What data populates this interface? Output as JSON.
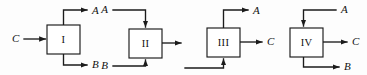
{
  "figure": {
    "type": "block-diagram",
    "background_color": "#fdfdfd",
    "line_color": "#1b1b1b",
    "box_fill": "#ffffff",
    "width": 367,
    "height": 75
  },
  "blocks": [
    {
      "id": "block-1",
      "label": "I",
      "box": {
        "x": 47,
        "y": 25,
        "w": 33,
        "h": 29
      },
      "ports": [
        {
          "name": "input-c",
          "label": "C",
          "side": "left",
          "direction": "in",
          "label_x": 12,
          "label_y": 39,
          "label_anchor": "start"
        },
        {
          "name": "output-a",
          "label": "A",
          "side": "top",
          "direction": "out",
          "label_x": 92,
          "label_y": 11,
          "label_anchor": "start"
        },
        {
          "name": "output-b",
          "label": "B",
          "side": "bottom",
          "direction": "out",
          "label_x": 92,
          "label_y": 65,
          "label_anchor": "start"
        }
      ]
    },
    {
      "id": "block-2",
      "label": "II",
      "box": {
        "x": 129,
        "y": 29,
        "w": 33,
        "h": 29
      },
      "ports": [
        {
          "name": "input-a",
          "label": "A",
          "side": "top",
          "direction": "in",
          "label_x": 108,
          "label_y": 10,
          "label_anchor": "end"
        },
        {
          "name": "input-b",
          "label": "B",
          "side": "bottom",
          "direction": "in",
          "label_x": 108,
          "label_y": 66,
          "label_anchor": "end"
        },
        {
          "name": "output-right",
          "label": "",
          "side": "right",
          "direction": "out",
          "label_x": 0,
          "label_y": 0,
          "label_anchor": "start"
        }
      ]
    },
    {
      "id": "block-3",
      "label": "III",
      "box": {
        "x": 207,
        "y": 28,
        "w": 33,
        "h": 29
      },
      "ports": [
        {
          "name": "input-bottom",
          "label": "",
          "side": "bottom",
          "direction": "in",
          "label_x": 0,
          "label_y": 0,
          "label_anchor": "start"
        },
        {
          "name": "output-a",
          "label": "A",
          "side": "top",
          "direction": "out",
          "label_x": 253,
          "label_y": 11,
          "label_anchor": "start"
        },
        {
          "name": "output-c",
          "label": "C",
          "side": "right",
          "direction": "out",
          "label_x": 267,
          "label_y": 42,
          "label_anchor": "start"
        }
      ]
    },
    {
      "id": "block-4",
      "label": "IV",
      "box": {
        "x": 290,
        "y": 28,
        "w": 33,
        "h": 29
      },
      "ports": [
        {
          "name": "input-a",
          "label": "A",
          "side": "top",
          "direction": "in",
          "label_x": 341,
          "label_y": 10,
          "label_anchor": "start"
        },
        {
          "name": "output-c",
          "label": "C",
          "side": "right",
          "direction": "out",
          "label_x": 352,
          "label_y": 42,
          "label_anchor": "start"
        },
        {
          "name": "output-b",
          "label": "B",
          "side": "bottom",
          "direction": "out",
          "label_x": 344,
          "label_y": 67,
          "label_anchor": "start"
        }
      ]
    }
  ],
  "labels": {
    "block_1": "I",
    "block_2": "II",
    "block_3": "III",
    "block_4": "IV",
    "b1_c": "C",
    "b1_a": "A",
    "b1_b": "B",
    "b2_a": "A",
    "b2_b": "B",
    "b3_a": "A",
    "b3_c": "C",
    "b4_a": "A",
    "b4_c": "C",
    "b4_b": "B"
  }
}
